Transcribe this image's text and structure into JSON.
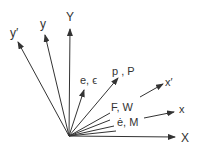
{
  "diagram": {
    "title": "",
    "labels": {
      "Y": "Y",
      "y": "y",
      "y_prime": "y′",
      "e_eps": "e, ϵ",
      "p_P": "p , P",
      "x_prime": "x′",
      "F_W": "F, W",
      "edot_M": "ė, M",
      "x": "x",
      "X": "X"
    },
    "colors": {
      "line": "#333333",
      "text": "#333333",
      "background": "#ffffff"
    }
  }
}
